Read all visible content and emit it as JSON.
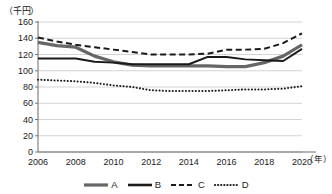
{
  "chart_data": {
    "type": "line",
    "title": "",
    "subtitle": "",
    "ylabel": "（千円）",
    "xlabel": "（年）",
    "ylim": [
      0,
      160
    ],
    "ytick_step": 20,
    "yticks": [
      "0",
      "20",
      "40",
      "60",
      "80",
      "100",
      "120",
      "140",
      "160"
    ],
    "xlim": [
      2006,
      2020
    ],
    "xticks": [
      "2006",
      "2008",
      "2010",
      "2012",
      "2014",
      "2016",
      "2018",
      "2020"
    ],
    "x": [
      2006,
      2007,
      2008,
      2009,
      2010,
      2011,
      2012,
      2013,
      2014,
      2015,
      2016,
      2017,
      2018,
      2019,
      2020
    ],
    "grid": true,
    "grid_axis": "y",
    "legend_position": "bottom",
    "series": [
      {
        "name": "A",
        "style": "solid-thick-gray",
        "color": "#666666",
        "values": [
          135,
          131,
          129,
          118,
          111,
          107,
          106,
          106,
          106,
          106,
          105,
          105,
          110,
          118,
          132
        ]
      },
      {
        "name": "B",
        "style": "solid-thin-black",
        "color": "#1a1a1a",
        "values": [
          115,
          115,
          115,
          111,
          110,
          108,
          108,
          108,
          108,
          117,
          117,
          114,
          113,
          112,
          127
        ]
      },
      {
        "name": "C",
        "style": "dashed-black",
        "color": "#1a1a1a",
        "values": [
          141,
          136,
          132,
          129,
          126,
          123,
          120,
          120,
          120,
          121,
          126,
          126,
          127,
          134,
          146
        ]
      },
      {
        "name": "D",
        "style": "dotted-black",
        "color": "#1a1a1a",
        "values": [
          89,
          88,
          87,
          85,
          82,
          80,
          76,
          75,
          75,
          75,
          76,
          77,
          77,
          78,
          81
        ]
      }
    ]
  },
  "legend": {
    "items": [
      {
        "label": "A"
      },
      {
        "label": "B"
      },
      {
        "label": "C"
      },
      {
        "label": "D"
      }
    ]
  }
}
